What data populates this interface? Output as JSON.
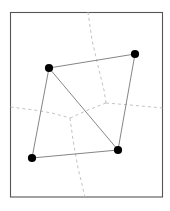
{
  "figure": {
    "canvas": {
      "width": 170,
      "height": 211,
      "background": "#ffffff"
    },
    "frame": {
      "label": "bounding-box",
      "x": 10.5,
      "y": 12.5,
      "width": 152,
      "height": 184.5,
      "stroke": "#555555",
      "stroke_width": 1.1,
      "fill": "#ffffff"
    },
    "style": {
      "solid_stroke": "#777777",
      "solid_width": 0.9,
      "dashed_stroke": "#bbbbbb",
      "dashed_width": 0.9,
      "dash_pattern": "3 3",
      "dot_fill": "#000000",
      "dot_radius": 4.1
    },
    "points": [
      {
        "id": "p1",
        "label": "upper-left-site",
        "x": 49,
        "y": 68
      },
      {
        "id": "p2",
        "label": "upper-right-site",
        "x": 135,
        "y": 54
      },
      {
        "id": "p3",
        "label": "lower-right-site",
        "x": 118,
        "y": 150
      },
      {
        "id": "p4",
        "label": "lower-left-site",
        "x": 32,
        "y": 158
      }
    ],
    "solid_edges": [
      {
        "id": "e1",
        "label": "top-edge",
        "x1": 49,
        "y1": 68,
        "x2": 135,
        "y2": 54
      },
      {
        "id": "e2",
        "label": "right-edge",
        "x1": 135,
        "y1": 54,
        "x2": 118,
        "y2": 150
      },
      {
        "id": "e3",
        "label": "bottom-edge",
        "x1": 118,
        "y1": 150,
        "x2": 32,
        "y2": 158
      },
      {
        "id": "e4",
        "label": "left-edge",
        "x1": 32,
        "y1": 158,
        "x2": 49,
        "y2": 68
      },
      {
        "id": "e5",
        "label": "diagonal",
        "x1": 49,
        "y1": 68,
        "x2": 118,
        "y2": 150
      }
    ],
    "dashed_edges": [
      {
        "id": "d1",
        "label": "upper-bisector",
        "points": "88,12 92,40 99,70 104,90 106,103"
      },
      {
        "id": "d2",
        "label": "left-bisector",
        "points": "10.5,107 34,110 52,113 70,118"
      },
      {
        "id": "d3",
        "label": "center-link",
        "points": "70,118 88,110 106,103"
      },
      {
        "id": "d4",
        "label": "right-bisector",
        "points": "106,103 130,105 162.5,108"
      },
      {
        "id": "d5",
        "label": "lower-bisector",
        "points": "70,118 73,140 78,168 85,197"
      }
    ]
  }
}
